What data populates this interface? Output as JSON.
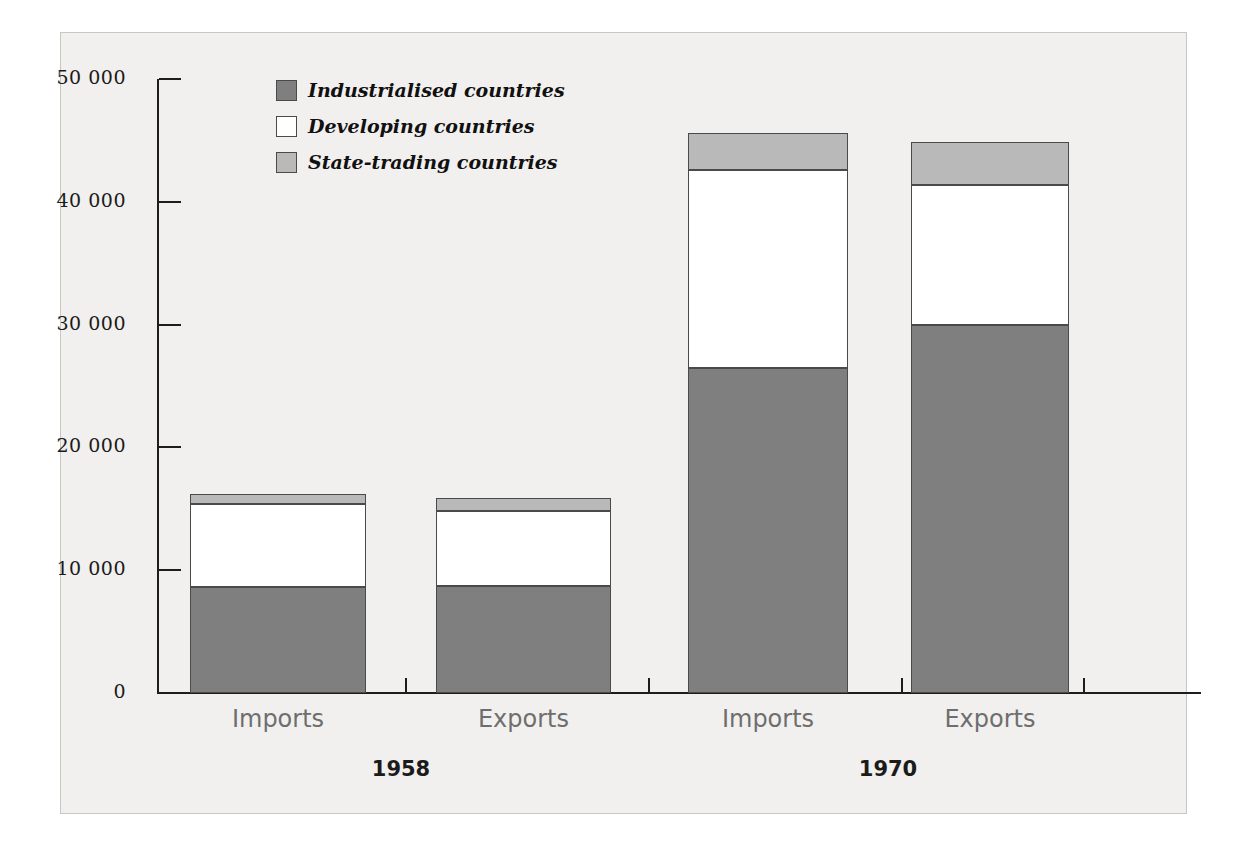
{
  "chart_data": {
    "type": "bar",
    "subtype": "stacked",
    "title": "",
    "xlabel": "",
    "ylabel": "",
    "ylim": [
      0,
      50000
    ],
    "yticks": [
      0,
      10000,
      20000,
      30000,
      40000,
      50000
    ],
    "ytick_labels": [
      "0",
      "10 000",
      "20 000",
      "30 000",
      "40 000",
      "50 000"
    ],
    "grid": false,
    "legend_position": "top-left-inside",
    "categories": [
      "Imports",
      "Exports",
      "Imports",
      "Exports"
    ],
    "groups": [
      "1958",
      "1970"
    ],
    "series": [
      {
        "name": "Industrialised countries",
        "color": "#7f7f7f",
        "values": [
          8600,
          8700,
          26500,
          30000
        ]
      },
      {
        "name": "Developing countries",
        "color": "#ffffff",
        "values": [
          6800,
          6150,
          16100,
          11400
        ]
      },
      {
        "name": "State-trading countries",
        "color": "#b9b9b9",
        "values": [
          800,
          1050,
          3000,
          3500
        ]
      }
    ],
    "totals": [
      16200,
      15900,
      45600,
      44900
    ]
  },
  "axis": {
    "ticks": [
      {
        "label": "50 000",
        "value": 50000
      },
      {
        "label": "40 000",
        "value": 40000
      },
      {
        "label": "30 000",
        "value": 30000
      },
      {
        "label": "20 000",
        "value": 20000
      },
      {
        "label": "10 000",
        "value": 10000
      },
      {
        "label": "0",
        "value": 0
      }
    ]
  },
  "legend": {
    "items": [
      {
        "label": "Industrialised countries",
        "color": "#7f7f7f"
      },
      {
        "label": "Developing countries",
        "color": "#ffffff"
      },
      {
        "label": "State-trading countries",
        "color": "#b9b9b9"
      }
    ]
  },
  "categories": [
    {
      "label": "Imports"
    },
    {
      "label": "Exports"
    },
    {
      "label": "Imports"
    },
    {
      "label": "Exports"
    }
  ],
  "groups": [
    {
      "label": "1958"
    },
    {
      "label": "1970"
    }
  ]
}
